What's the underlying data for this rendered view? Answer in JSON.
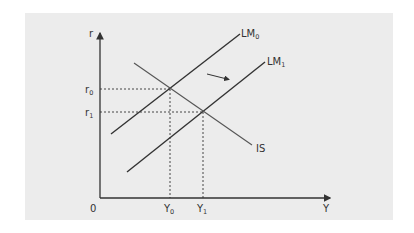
{
  "diagram": {
    "type": "IS-LM model",
    "background_color": "#ececec",
    "line_color": "#333333",
    "is_line_color": "#555555",
    "axes": {
      "y_label": "r",
      "x_label": "Y",
      "origin_label": "0"
    },
    "y_ticks": [
      {
        "main": "r",
        "sub": "0"
      },
      {
        "main": "r",
        "sub": "1"
      }
    ],
    "x_ticks": [
      {
        "main": "Y",
        "sub": "0"
      },
      {
        "main": "Y",
        "sub": "1"
      }
    ],
    "curves": [
      {
        "id": "LM0",
        "main": "LM",
        "sub": "0"
      },
      {
        "id": "LM1",
        "main": "LM",
        "sub": "1"
      },
      {
        "id": "IS",
        "main": "IS",
        "sub": ""
      }
    ],
    "shift_arrow": "LM0 shifts right to LM1"
  }
}
